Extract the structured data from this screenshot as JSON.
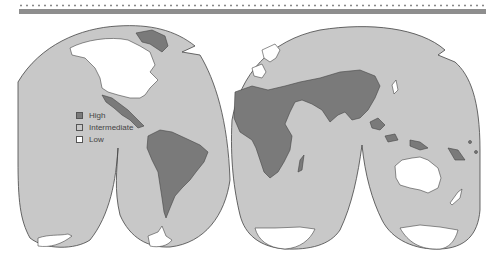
{
  "map": {
    "projection": "interrupted-homolosine",
    "colors": {
      "high": "#7a7a7a",
      "intermediate": "#c8c8c8",
      "low": "#ffffff",
      "outline": "#444444",
      "header_rule": "#8e8e8e"
    },
    "legend": {
      "items": [
        {
          "label": "High",
          "color": "#7a7a7a"
        },
        {
          "label": "Intermediate",
          "color": "#c8c8c8"
        },
        {
          "label": "Low",
          "color": "#ffffff"
        }
      ]
    },
    "regions": {
      "high": [
        "Greenland",
        "Mexico",
        "Central America",
        "South America",
        "Africa",
        "Middle East",
        "South Asia",
        "China",
        "Southeast Asia",
        "Pacific Islands"
      ],
      "intermediate": [
        "Russia",
        "Southern Europe",
        "Eastern Europe",
        "Oceans (background)"
      ],
      "low": [
        "North America (USA/Canada)",
        "Western/Northern Europe",
        "Australia",
        "New Zealand",
        "Antarctica",
        "Japan"
      ]
    }
  }
}
